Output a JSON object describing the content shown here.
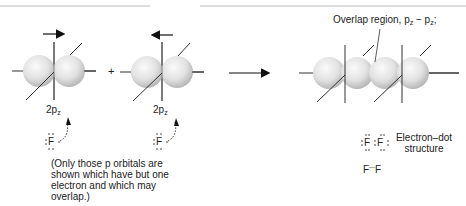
{
  "diagram": {
    "operator_plus": "+",
    "atoms": [
      {
        "orbital_label": "2p",
        "orbital_sub": "z",
        "element": "F",
        "arrow_direction": "right"
      },
      {
        "orbital_label": "2p",
        "orbital_sub": "z",
        "element": "F",
        "arrow_direction": "left"
      }
    ],
    "overlap_label": "Overlap region, p",
    "overlap_sub1": "z",
    "overlap_dash": " − p",
    "overlap_sub2": "z",
    "overlap_end": ";",
    "note": "(Only those p orbitals are shown which have but one electron and which may overlap.)",
    "note_lines": [
      "(Only those p orbitals are",
      "shown which have but one",
      "electron and which may",
      "overlap.)"
    ],
    "electron_dot": {
      "element_left": "F",
      "element_right": "F",
      "label_line1": "Electron–dot",
      "label_line2": "structure"
    },
    "bond_formula": {
      "left": "F",
      "bond": "—",
      "right": "F"
    },
    "colors": {
      "lobe_light": "#f4f4f4",
      "lobe_dark": "#bdbdbd",
      "line": "#333333",
      "arrow": "#111111"
    }
  }
}
